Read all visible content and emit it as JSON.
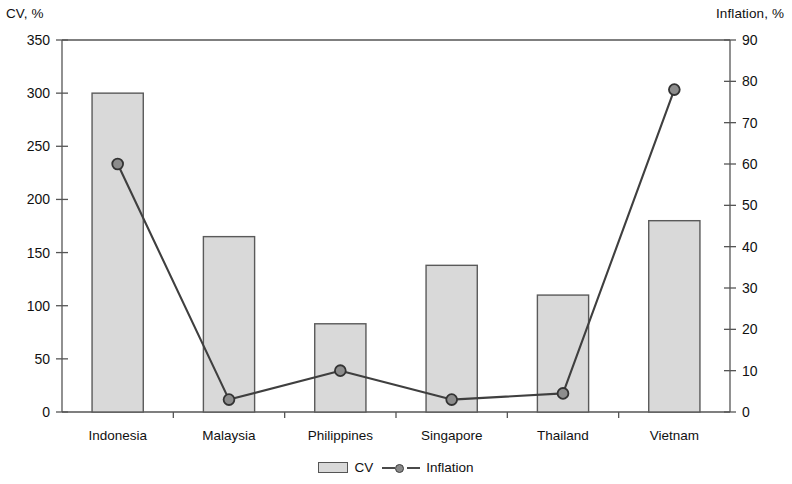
{
  "chart_data": {
    "type": "bar",
    "title": "",
    "categories": [
      "Indonesia",
      "Malaysia",
      "Philippines",
      "Singapore",
      "Thailand",
      "Vietnam"
    ],
    "xlabel": "",
    "ylabel": "CV, %",
    "y2label": "Inflation, %",
    "ylim": [
      0,
      350
    ],
    "y2lim": [
      0,
      90
    ],
    "ytick_step": 50,
    "y2tick_step": 10,
    "yticks": [
      "0",
      "50",
      "100",
      "150",
      "200",
      "250",
      "300",
      "350"
    ],
    "y2ticks": [
      "0",
      "10",
      "20",
      "30",
      "40",
      "50",
      "60",
      "70",
      "80",
      "90"
    ],
    "grid": false,
    "legend_position": "bottom-center",
    "series": [
      {
        "name": "CV",
        "type": "bar",
        "axis": "left",
        "color": "#d9d9d9",
        "border_color": "#5a5a5a",
        "values": [
          300,
          165,
          83,
          138,
          110,
          180
        ]
      },
      {
        "name": "Inflation",
        "type": "line",
        "axis": "right",
        "color": "#3f3f3f",
        "marker_color": "#8d8d8d",
        "values": [
          60,
          3,
          10,
          3,
          4.5,
          78
        ]
      }
    ]
  },
  "axes": {
    "left_title": "CV, %",
    "right_title": "Inflation, %"
  },
  "legend": {
    "items": [
      {
        "label": "CV",
        "swatch": "bar-swatch"
      },
      {
        "label": "Inflation",
        "swatch": "line-marker-swatch"
      }
    ]
  }
}
